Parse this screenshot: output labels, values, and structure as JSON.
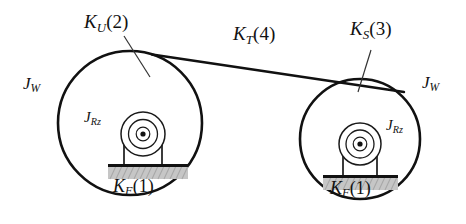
{
  "diagram": {
    "type": "mechanical-schematic",
    "background_color": "#ffffff",
    "line_color": "#111111",
    "ground_fill_color": "#c9c9c9",
    "ground_edge_color": "#1a1a1a",
    "labels": {
      "k_u": {
        "symbol": "K",
        "subscript": "U",
        "index": "(2)"
      },
      "k_t": {
        "symbol": "K",
        "subscript": "T",
        "index": "(4)"
      },
      "k_s": {
        "symbol": "K",
        "subscript": "S",
        "index": "(3)"
      },
      "k_f_left": {
        "symbol": "K",
        "subscript": "F",
        "index": "(1)"
      },
      "k_f_right": {
        "symbol": "K",
        "subscript": "F",
        "index": "(1)"
      },
      "j_w_left": {
        "symbol": "J",
        "subscript": "W"
      },
      "j_w_right": {
        "symbol": "J",
        "subscript": "W"
      },
      "j_rz_left": {
        "symbol": "J",
        "subscript": "Rz"
      },
      "j_rz_right": {
        "symbol": "J",
        "subscript": "Rz"
      }
    },
    "geometry": {
      "left_wheel": {
        "cx": 130,
        "cy": 123,
        "r": 80
      },
      "right_wheel": {
        "cx": 360,
        "cy": 139,
        "r": 66
      },
      "left_roller": {
        "cx": 143,
        "cy": 134,
        "r_outer": 22,
        "r_mid": 15,
        "r_hub": 7,
        "r_dot": 2.6
      },
      "right_roller": {
        "cx": 360,
        "cy": 144,
        "r_outer": 21,
        "r_mid": 14,
        "r_hub": 7,
        "r_dot": 2.6
      },
      "left_ground": {
        "x": 108,
        "y": 165,
        "w": 78,
        "h": 13
      },
      "right_ground": {
        "x": 323,
        "y": 176,
        "w": 74,
        "h": 13
      },
      "belt_tangent": {
        "x1": 175,
        "y1": 54,
        "x2": 390,
        "y2": 82
      }
    }
  }
}
